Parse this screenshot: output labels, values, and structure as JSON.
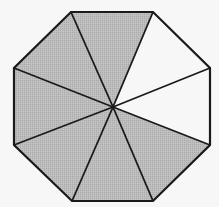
{
  "diagram": {
    "shape": "regular-octagon",
    "center": [
      113,
      107
    ],
    "vertices": [
      [
        71,
        12
      ],
      [
        153,
        12
      ],
      [
        210,
        68
      ],
      [
        210,
        145
      ],
      [
        153,
        201
      ],
      [
        72,
        201
      ],
      [
        14,
        145
      ],
      [
        14,
        68
      ]
    ],
    "total_parts": 8,
    "shaded_parts": 6,
    "segments": [
      {
        "name": "top",
        "shaded": true
      },
      {
        "name": "top-right",
        "shaded": false
      },
      {
        "name": "right",
        "shaded": false
      },
      {
        "name": "bottom-right",
        "shaded": true
      },
      {
        "name": "bottom",
        "shaded": true
      },
      {
        "name": "bottom-left",
        "shaded": true
      },
      {
        "name": "left",
        "shaded": true
      },
      {
        "name": "top-left",
        "shaded": true
      }
    ],
    "colors": {
      "shaded": "#b9b9b9",
      "unshaded": "#f7f7f7",
      "stroke": "#1a1a1a",
      "background": "#f7f7f7"
    }
  }
}
